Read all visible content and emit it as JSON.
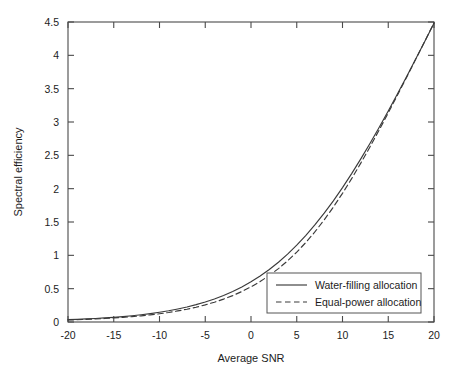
{
  "chart_data": {
    "type": "line",
    "title": "",
    "xlabel": "Average SNR",
    "ylabel": "Spectral efficiency",
    "xlim": [
      -20,
      20
    ],
    "ylim": [
      0,
      4.5
    ],
    "xticks": [
      -20,
      -15,
      -10,
      -5,
      0,
      5,
      10,
      15,
      20
    ],
    "xtick_labels": [
      "-20",
      "-15",
      "-10",
      "-5",
      "0",
      "5",
      "10",
      "15",
      "20"
    ],
    "yticks": [
      0,
      0.5,
      1,
      1.5,
      2,
      2.5,
      3,
      3.5,
      4,
      4.5
    ],
    "ytick_labels": [
      "0",
      "0.5",
      "1",
      "1.5",
      "2",
      "2.5",
      "3",
      "3.5",
      "4",
      "4.5"
    ],
    "grid": false,
    "legend_position": "lower right",
    "x": [
      -20,
      -19,
      -18,
      -17,
      -16,
      -15,
      -14,
      -13,
      -12,
      -11,
      -10,
      -9,
      -8,
      -7,
      -6,
      -5,
      -4,
      -3,
      -2,
      -1,
      0,
      1,
      2,
      3,
      4,
      5,
      6,
      7,
      8,
      9,
      10,
      11,
      12,
      13,
      14,
      15,
      16,
      17,
      18,
      19,
      20
    ],
    "series": [
      {
        "name": "Water-filling allocation",
        "style": "solid",
        "color": "#3a3a3a",
        "values": [
          0.035,
          0.04,
          0.046,
          0.053,
          0.061,
          0.07,
          0.081,
          0.094,
          0.109,
          0.126,
          0.146,
          0.168,
          0.195,
          0.225,
          0.26,
          0.3,
          0.346,
          0.398,
          0.458,
          0.526,
          0.603,
          0.69,
          0.788,
          0.897,
          1.018,
          1.152,
          1.299,
          1.459,
          1.632,
          1.818,
          2.016,
          2.226,
          2.447,
          2.678,
          2.918,
          3.166,
          3.42,
          3.68,
          3.944,
          4.212,
          4.482
        ]
      },
      {
        "name": "Equal-power allocation",
        "style": "dashed",
        "color": "#3a3a3a",
        "values": [
          0.03,
          0.034,
          0.039,
          0.045,
          0.052,
          0.06,
          0.069,
          0.08,
          0.092,
          0.107,
          0.124,
          0.143,
          0.166,
          0.192,
          0.222,
          0.257,
          0.297,
          0.343,
          0.396,
          0.457,
          0.527,
          0.607,
          0.698,
          0.801,
          0.917,
          1.048,
          1.194,
          1.355,
          1.532,
          1.724,
          1.93,
          2.15,
          2.383,
          2.626,
          2.878,
          3.137,
          3.401,
          3.669,
          3.94,
          4.213,
          4.487
        ]
      }
    ],
    "legend_entries": [
      "Water-filling allocation",
      "Equal-power allocation"
    ]
  },
  "axes": {
    "frame_color": "#4a4a4a",
    "background": "#ffffff"
  }
}
